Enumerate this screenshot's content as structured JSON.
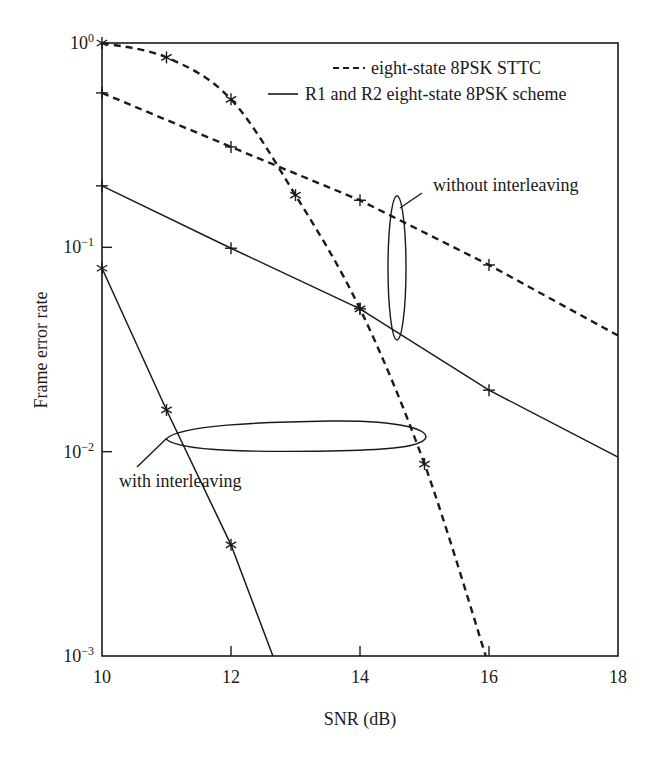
{
  "chart_data": {
    "type": "line",
    "title": "",
    "xlabel": "SNR (dB)",
    "ylabel": "Frame error rate",
    "xscale": "linear",
    "yscale": "log",
    "xlim": [
      10,
      18
    ],
    "ylim": [
      0.001,
      1
    ],
    "xticks": [
      10,
      12,
      14,
      16,
      18
    ],
    "xtick_labels": [
      "10",
      "12",
      "14",
      "16",
      "18"
    ],
    "yticks": [
      1,
      0.1,
      0.01,
      0.001
    ],
    "ytick_labels": [
      {
        "base": "10",
        "exp": "0"
      },
      {
        "base": "10",
        "exp": "−1"
      },
      {
        "base": "10",
        "exp": "−2"
      },
      {
        "base": "10",
        "exp": "−3"
      }
    ],
    "grid": false,
    "legend": {
      "position": "upper right",
      "entries": [
        {
          "label": "eight-state 8PSK STTC",
          "style": "dashed"
        },
        {
          "label": "R1 and R2 eight-state 8PSK scheme",
          "style": "solid"
        }
      ]
    },
    "series": [
      {
        "name": "eight-state 8PSK STTC (with interleaving)",
        "style": "dashed",
        "marker": "star",
        "x": [
          10,
          11,
          12,
          13,
          14,
          15,
          15.95
        ],
        "y": [
          1.0,
          0.85,
          0.53,
          0.18,
          0.05,
          0.0087,
          0.001
        ],
        "marker_points": [
          0,
          1,
          2,
          3,
          4,
          5
        ]
      },
      {
        "name": "eight-state 8PSK STTC (without interleaving)",
        "style": "dashed",
        "marker": "plus",
        "x": [
          10,
          12,
          14,
          16,
          18
        ],
        "y": [
          0.57,
          0.31,
          0.17,
          0.082,
          0.037
        ],
        "marker_points": [
          0,
          1,
          2,
          3
        ]
      },
      {
        "name": "R1 and R2 eight-state 8PSK scheme (without interleaving)",
        "style": "solid",
        "marker": "plus",
        "x": [
          10,
          12,
          14,
          16,
          18
        ],
        "y": [
          0.2,
          0.099,
          0.05,
          0.02,
          0.0094
        ],
        "marker_points": [
          0,
          1,
          2,
          3
        ]
      },
      {
        "name": "R1 and R2 eight-state 8PSK scheme (with interleaving)",
        "style": "solid",
        "marker": "star",
        "x": [
          10,
          11,
          12,
          12.65
        ],
        "y": [
          0.079,
          0.016,
          0.0035,
          0.001
        ],
        "marker_points": [
          0,
          1,
          2
        ]
      }
    ],
    "annotations": [
      {
        "text": "without interleaving",
        "x": 15.1,
        "y": 0.18
      },
      {
        "text": "with interleaving",
        "x": 10.3,
        "y": 0.0067
      }
    ]
  }
}
